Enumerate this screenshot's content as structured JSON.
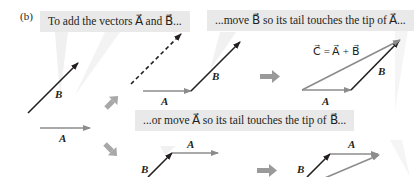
{
  "figure": {
    "panel_label": "(b)",
    "bubbles": [
      {
        "id": "intro",
        "text": "To add the vectors A⃗ and B⃗..."
      },
      {
        "id": "move-b",
        "text": "...move B⃗ so its tail touches the tip of A⃗..."
      },
      {
        "id": "move-a",
        "text": "...or move A⃗ so its tail touches the tip of B⃗..."
      }
    ],
    "vector_labels": {
      "A": "A⃗",
      "B": "B⃗"
    },
    "result_equation": "C⃗ = A⃗ + B⃗",
    "colors": {
      "vector_A": "#8c8c8c",
      "vector_B": "#231f20",
      "vector_C": "#8c8c8c",
      "step_arrow": "#9a9a9a",
      "bubble_bg": "#e9e9e9",
      "bubble_tail": "#efefef"
    },
    "icons": [
      "right-arrow-icon",
      "diagonal-up-arrow-icon",
      "diagonal-down-arrow-icon"
    ]
  }
}
